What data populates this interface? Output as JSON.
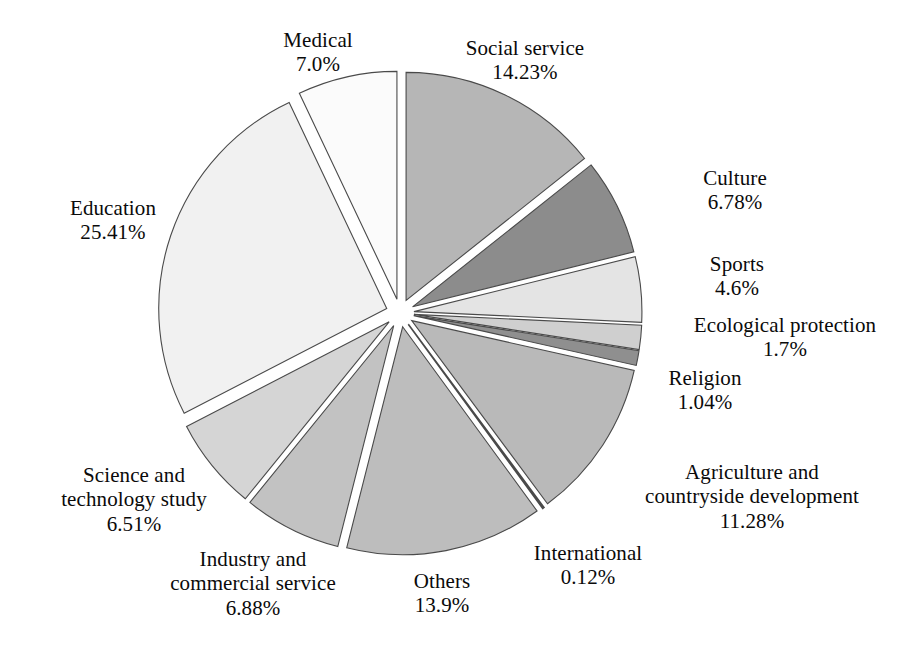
{
  "chart_data": {
    "type": "pie",
    "title": "",
    "subtitle": "",
    "xlabel": "",
    "ylabel": "",
    "legend_position": "none",
    "grid": false,
    "exploded": true,
    "start_angle_deg": 0,
    "direction": "clockwise",
    "categories": [
      "Social service",
      "Culture",
      "Sports",
      "Ecological protection",
      "Religion",
      "Agriculture and countryside development",
      "International",
      "Others",
      "Industry and commercial service",
      "Science and technology study",
      "Education",
      "Medical"
    ],
    "values": [
      14.23,
      6.78,
      4.6,
      1.7,
      1.04,
      11.28,
      0.12,
      13.9,
      6.88,
      6.51,
      25.41,
      7.0
    ],
    "value_labels": [
      "14.23%",
      "6.78%",
      "4.6%",
      "1.7%",
      "1.04%",
      "11.28%",
      "0.12%",
      "13.9%",
      "6.88%",
      "6.51%",
      "25.41%",
      "7.0%"
    ],
    "unit": "%",
    "colors": [
      "#b6b6b6",
      "#8c8c8c",
      "#e4e4e4",
      "#cfcfcf",
      "#8f8f8f",
      "#b9b9b9",
      "#6e6e6e",
      "#bdbdbd",
      "#c2c2c2",
      "#d5d5d5",
      "#f1f1f1",
      "#fbfbfb"
    ],
    "slices": [
      {
        "name": "Social service",
        "value": 14.23,
        "value_label": "14.23%",
        "color": "#b6b6b6"
      },
      {
        "name": "Culture",
        "value": 6.78,
        "value_label": "6.78%",
        "color": "#8c8c8c"
      },
      {
        "name": "Sports",
        "value": 4.6,
        "value_label": "4.6%",
        "color": "#e4e4e4"
      },
      {
        "name": "Ecological protection",
        "value": 1.7,
        "value_label": "1.7%",
        "color": "#cfcfcf"
      },
      {
        "name": "Religion",
        "value": 1.04,
        "value_label": "1.04%",
        "color": "#8f8f8f"
      },
      {
        "name": "Agriculture and countryside development",
        "value": 11.28,
        "value_label": "11.28%",
        "color": "#b9b9b9"
      },
      {
        "name": "International",
        "value": 0.12,
        "value_label": "0.12%",
        "color": "#6e6e6e"
      },
      {
        "name": "Others",
        "value": 13.9,
        "value_label": "13.9%",
        "color": "#bdbdbd"
      },
      {
        "name": "Industry and commercial service",
        "value": 6.88,
        "value_label": "6.88%",
        "color": "#c2c2c2"
      },
      {
        "name": "Science and technology study",
        "value": 6.51,
        "value_label": "6.51%",
        "color": "#d5d5d5"
      },
      {
        "name": "Education",
        "value": 25.41,
        "value_label": "25.41%",
        "color": "#f1f1f1"
      },
      {
        "name": "Medical",
        "value": 7.0,
        "value_label": "7.0%",
        "color": "#fbfbfb"
      }
    ]
  },
  "labels": {
    "medical": {
      "name": "Medical",
      "value": "7.0%"
    },
    "social": {
      "name": "Social service",
      "value": "14.23%"
    },
    "culture": {
      "name": "Culture",
      "value": "6.78%"
    },
    "sports": {
      "name": "Sports",
      "value": "4.6%"
    },
    "eco": {
      "name": "Ecological protection",
      "value": "1.7%"
    },
    "religion": {
      "name": "Religion",
      "value": "1.04%"
    },
    "agri": {
      "name_line1": "Agriculture and",
      "name_line2": "countryside development",
      "value": "11.28%"
    },
    "intl": {
      "name": "International",
      "value": "0.12%"
    },
    "others": {
      "name": "Others",
      "value": "13.9%"
    },
    "industry": {
      "name_line1": "Industry and",
      "name_line2": "commercial service",
      "value": "6.88%"
    },
    "science": {
      "name_line1": "Science and",
      "name_line2": "technology study",
      "value": "6.51%"
    },
    "education": {
      "name": "Education",
      "value": "25.41%"
    }
  },
  "style": {
    "background": "#ffffff",
    "outline_color": "#4a4a4a",
    "text_color": "#0a0a0a"
  }
}
